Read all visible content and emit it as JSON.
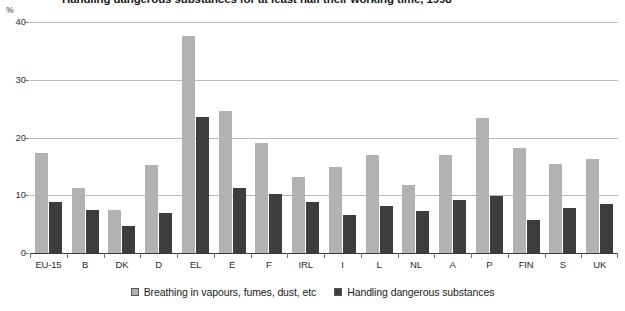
{
  "chart_data": {
    "type": "bar",
    "title": "Handling dangerous substances for at least half their working time, 1998",
    "xlabel": "",
    "ylabel": "%",
    "ylim": [
      0,
      40
    ],
    "yticks": [
      0,
      10,
      20,
      30,
      40
    ],
    "grid": true,
    "legend_position": "bottom",
    "categories": [
      "EU-15",
      "B",
      "DK",
      "D",
      "EL",
      "E",
      "F",
      "IRL",
      "I",
      "L",
      "NL",
      "A",
      "P",
      "FIN",
      "S",
      "UK"
    ],
    "series": [
      {
        "name": "Breathing in vapours, fumes, dust, etc",
        "color": "#b2b2b2",
        "values": [
          17.3,
          11.2,
          7.5,
          15.3,
          37.5,
          24.6,
          19.0,
          13.2,
          14.9,
          16.9,
          11.7,
          17.0,
          23.3,
          18.1,
          15.4,
          16.2
        ]
      },
      {
        "name": "Handling dangerous substances",
        "color": "#3d3d3d",
        "values": [
          8.8,
          7.4,
          4.7,
          7.0,
          23.5,
          11.3,
          10.3,
          8.9,
          6.6,
          8.1,
          7.2,
          9.1,
          9.9,
          5.7,
          7.8,
          8.5
        ]
      }
    ]
  },
  "axis": {
    "unit_label": "%"
  },
  "legend": {
    "items": [
      {
        "label": "Breathing in vapours, fumes, dust, etc"
      },
      {
        "label": "Handling dangerous substances"
      }
    ]
  }
}
